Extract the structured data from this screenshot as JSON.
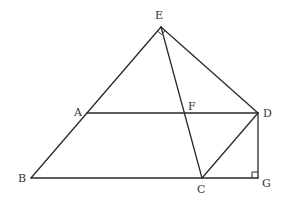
{
  "diagram": {
    "type": "geometry",
    "points": {
      "E": {
        "x": 161,
        "y": 27,
        "label": "E",
        "lx": 155,
        "ly": 19
      },
      "A": {
        "x": 87,
        "y": 113,
        "label": "A",
        "lx": 74,
        "ly": 116
      },
      "F": {
        "x": 185,
        "y": 113,
        "label": "F",
        "lx": 188,
        "ly": 110
      },
      "D": {
        "x": 258,
        "y": 113,
        "label": "D",
        "lx": 263,
        "ly": 117
      },
      "B": {
        "x": 31,
        "y": 178,
        "label": "B",
        "lx": 18,
        "ly": 182
      },
      "C": {
        "x": 202,
        "y": 178,
        "label": "C",
        "lx": 197,
        "ly": 193
      },
      "G": {
        "x": 258,
        "y": 178,
        "label": "G",
        "lx": 262,
        "ly": 187
      }
    },
    "segments": [
      [
        "E",
        "B"
      ],
      [
        "E",
        "D"
      ],
      [
        "E",
        "C"
      ],
      [
        "A",
        "D"
      ],
      [
        "B",
        "G"
      ],
      [
        "C",
        "D"
      ],
      [
        "D",
        "G"
      ]
    ],
    "right_angles": [
      "E",
      "G"
    ]
  },
  "labels": {
    "E": "E",
    "A": "A",
    "F": "F",
    "D": "D",
    "B": "B",
    "C": "C",
    "G": "G"
  }
}
